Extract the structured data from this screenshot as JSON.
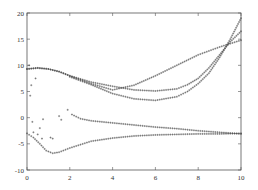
{
  "chart_data": {
    "type": "scatter",
    "title": "",
    "xlabel": "",
    "ylabel": "",
    "xlim": [
      0,
      10
    ],
    "ylim": [
      -10,
      20
    ],
    "grid": false,
    "legend": null,
    "x_ticks": [
      "0",
      "2",
      "4",
      "6",
      "8",
      "10"
    ],
    "y_ticks": [
      "-10",
      "-5",
      "0",
      "5",
      "10",
      "15",
      "20"
    ],
    "marker": "+",
    "series": [
      {
        "name": "branch-1",
        "x": [
          0,
          0.5,
          1,
          1.5,
          2,
          3,
          4,
          5,
          6,
          7,
          8,
          9,
          10
        ],
        "y": [
          9.3,
          9.5,
          9.3,
          8.8,
          8.0,
          6.5,
          5.3,
          6.2,
          8.0,
          10.0,
          12.0,
          13.5,
          14.8
        ]
      },
      {
        "name": "branch-2",
        "x": [
          0,
          0.5,
          1,
          1.5,
          2,
          3,
          4,
          5,
          6,
          7,
          7.5,
          8,
          8.5,
          9,
          9.5,
          10
        ],
        "y": [
          9.3,
          9.5,
          9.3,
          8.8,
          8.0,
          6.8,
          6.0,
          5.3,
          5.1,
          5.5,
          6.3,
          7.5,
          9.5,
          12.0,
          14.5,
          16.5
        ]
      },
      {
        "name": "branch-3",
        "x": [
          2,
          3,
          4,
          5,
          6,
          7,
          7.5,
          8,
          8.5,
          9,
          9.5,
          10
        ],
        "y": [
          7.8,
          6.3,
          4.6,
          3.6,
          3.3,
          4.0,
          5.0,
          6.5,
          8.5,
          11.5,
          15.0,
          19.0
        ]
      },
      {
        "name": "branch-4",
        "x": [
          2.1,
          2.5,
          3,
          4,
          5,
          6,
          7,
          8,
          9,
          10
        ],
        "y": [
          0.6,
          -0.2,
          -0.6,
          -1.0,
          -1.4,
          -1.8,
          -2.1,
          -2.5,
          -2.8,
          -3.1
        ]
      },
      {
        "name": "branch-5",
        "x": [
          0,
          0.3,
          0.6,
          0.9,
          1.2,
          1.5,
          2,
          3,
          4,
          5,
          6,
          7,
          8,
          9,
          10
        ],
        "y": [
          -3.0,
          -3.8,
          -5.0,
          -6.3,
          -6.8,
          -6.6,
          -5.8,
          -4.5,
          -3.9,
          -3.5,
          -3.3,
          -3.2,
          -3.1,
          -3.1,
          -3.0
        ]
      },
      {
        "name": "scatter",
        "x": [
          0.1,
          0.15,
          0.2,
          0.25,
          0.3,
          0.4,
          0.5,
          0.6,
          0.7,
          0.75,
          1.1,
          1.2,
          1.5,
          1.6,
          1.9
        ],
        "y": [
          10.0,
          4.2,
          6.2,
          -0.8,
          -2.8,
          7.5,
          -3.2,
          -2.0,
          -4.0,
          -0.3,
          -3.8,
          -4.0,
          0.3,
          -0.4,
          1.5
        ]
      }
    ]
  }
}
